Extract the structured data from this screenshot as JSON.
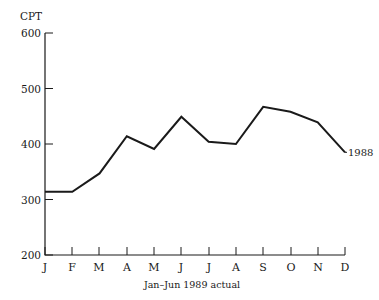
{
  "chart_data": {
    "type": "line",
    "title": "",
    "subtitle": "",
    "xlabel": "Jan–Jun 1989 actual",
    "ylabel": "CPT",
    "ylim": [
      200,
      600
    ],
    "y_ticks": [
      200,
      300,
      400,
      500,
      600
    ],
    "y_tick_labels": [
      "200",
      "300",
      "400",
      "500",
      "600"
    ],
    "grid": false,
    "legend_position": "inline-right-end",
    "categories": [
      "J",
      "F",
      "M",
      "A",
      "M",
      "J",
      "J",
      "A",
      "S",
      "O",
      "N",
      "D"
    ],
    "category_full_names": [
      "January",
      "February",
      "March",
      "April",
      "May",
      "June",
      "July",
      "August",
      "September",
      "October",
      "November",
      "December"
    ],
    "series": [
      {
        "name": "1988",
        "values": [
          314,
          314,
          347,
          414,
          391,
          449,
          404,
          400,
          467,
          458,
          439,
          385
        ]
      }
    ],
    "annotations": [
      {
        "text": "1988",
        "attach_to": "series-end"
      }
    ],
    "colors": {
      "line": "#1a1a1a",
      "axis": "#1a1a1a",
      "background": "#ffffff"
    }
  },
  "axes": {
    "y_unit_label": "CPT",
    "x_caption": "Jan–Jun 1989 actual"
  }
}
